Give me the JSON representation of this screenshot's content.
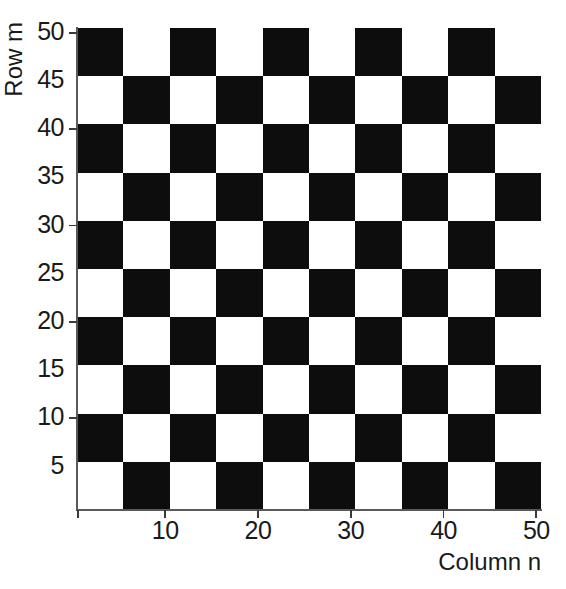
{
  "figure": {
    "background_color": "#ffffff",
    "dark_color": "#0d0d0d",
    "light_color": "#ffffff",
    "axis_color": "#5a5a5a"
  },
  "axes": {
    "x_title": "Column n",
    "y_title": "Row m",
    "x_tick_labels": [
      "10",
      "20",
      "30",
      "40",
      "50"
    ],
    "x_tick_values": [
      10,
      20,
      30,
      40,
      50
    ],
    "y_tick_labels": [
      "5",
      "10",
      "15",
      "20",
      "25",
      "30",
      "35",
      "40",
      "45",
      "50"
    ],
    "y_tick_values": [
      5,
      10,
      15,
      20,
      25,
      30,
      35,
      40,
      45,
      50
    ],
    "y_minor_tick_values": [
      10,
      20,
      30,
      40,
      50
    ]
  },
  "chart_data": {
    "type": "heatmap",
    "title": "",
    "subtitle": "",
    "xlabel": "Column n",
    "ylabel": "Row m",
    "xlim": [
      0.5,
      50.5
    ],
    "ylim": [
      50.5,
      0.5
    ],
    "y_inverted": true,
    "grid": false,
    "legend": null,
    "colormap": "binary",
    "block_size": 5,
    "blocks_per_side": 10,
    "xticklabels": [
      "10",
      "20",
      "30",
      "40",
      "50"
    ],
    "yticklabels": [
      "5",
      "10",
      "15",
      "20",
      "25",
      "30",
      "35",
      "40",
      "45",
      "50"
    ],
    "x": [
      10,
      20,
      30,
      40,
      50
    ],
    "y": [
      5,
      10,
      15,
      20,
      25,
      30,
      35,
      40,
      45,
      50
    ],
    "block_matrix": [
      [
        1,
        0,
        1,
        0,
        1,
        0,
        1,
        0,
        1,
        0
      ],
      [
        0,
        1,
        0,
        1,
        0,
        1,
        0,
        1,
        0,
        1
      ],
      [
        1,
        0,
        1,
        0,
        1,
        0,
        1,
        0,
        1,
        0
      ],
      [
        0,
        1,
        0,
        1,
        0,
        1,
        0,
        1,
        0,
        1
      ],
      [
        1,
        0,
        1,
        0,
        1,
        0,
        1,
        0,
        1,
        0
      ],
      [
        0,
        1,
        0,
        1,
        0,
        1,
        0,
        1,
        0,
        1
      ],
      [
        1,
        0,
        1,
        0,
        1,
        0,
        1,
        0,
        1,
        0
      ],
      [
        0,
        1,
        0,
        1,
        0,
        1,
        0,
        1,
        0,
        1
      ],
      [
        1,
        0,
        1,
        0,
        1,
        0,
        1,
        0,
        1,
        0
      ],
      [
        0,
        1,
        0,
        1,
        0,
        1,
        0,
        1,
        0,
        1
      ]
    ]
  }
}
